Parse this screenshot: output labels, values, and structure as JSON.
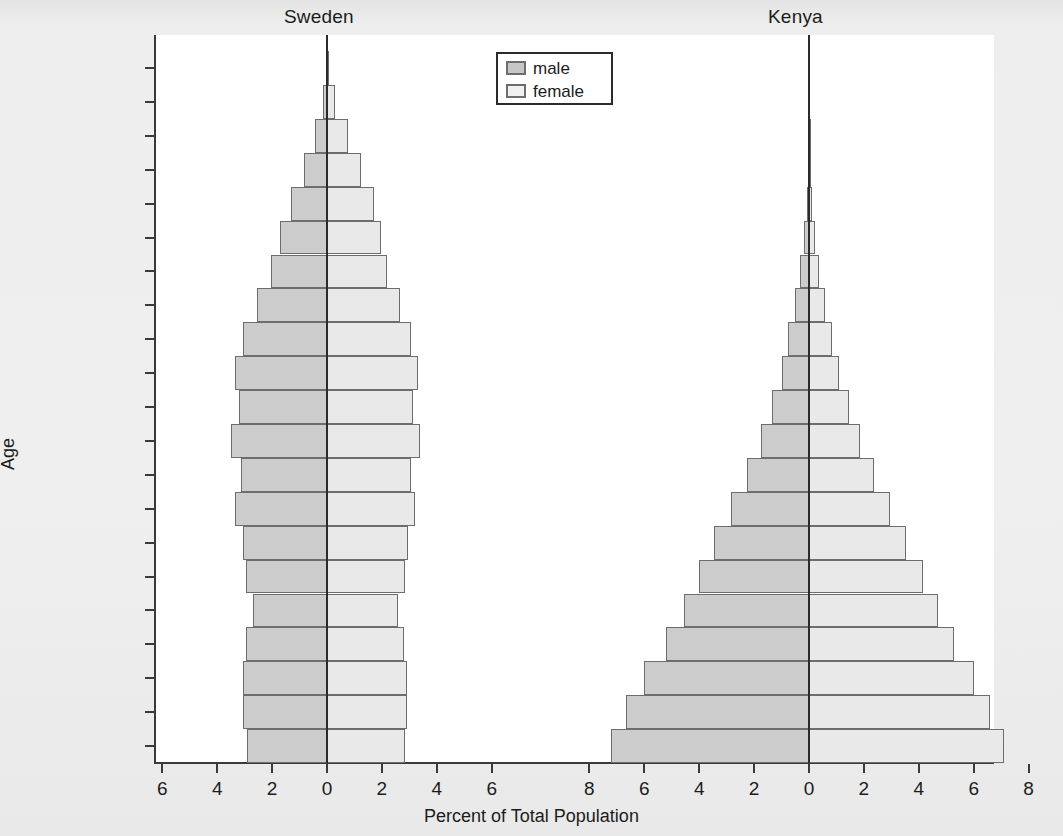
{
  "figure": {
    "x_axis_title": "Percent of Total Population",
    "y_axis_title": "Age",
    "panels": [
      {
        "id": "sweden",
        "title": "Sweden"
      },
      {
        "id": "kenya",
        "title": "Kenya"
      }
    ]
  },
  "legend": {
    "male_label": "male",
    "female_label": "female",
    "male_color": "#cccccc",
    "female_color": "#e9e9e9"
  },
  "chart_data": {
    "type": "bar",
    "subtype": "population-pyramid",
    "title": "",
    "xlabel": "Percent of Total Population",
    "ylabel": "Age",
    "grid": false,
    "legend_position": "top-center",
    "categories": [
      "0–4",
      "5–9",
      "10–14",
      "15–19",
      "20–24",
      "25–29",
      "30–34",
      "35–39",
      "40–44",
      "45–49",
      "50–54",
      "55–59",
      "60–64",
      "65–69",
      "70–74",
      "75–79",
      "80–84",
      "85–89",
      "90–94",
      "95–99",
      "100+"
    ],
    "y_tick_labels": [
      "100+",
      "95–99",
      "90–94",
      "85–89",
      "80–84",
      "75–79",
      "70–74",
      "65–69",
      "60–64",
      "55–59",
      "50–54",
      "45–49",
      "40–44",
      "35–39",
      "30–34",
      "25–29",
      "20–24",
      "15–19",
      "10–14",
      "5–9",
      "0–4"
    ],
    "x_tick_labels": [
      "6",
      "4",
      "2",
      "0",
      "2",
      "4",
      "6",
      "8",
      "6",
      "4",
      "2",
      "0",
      "2",
      "4",
      "6",
      "8"
    ],
    "panels": [
      {
        "name": "Sweden",
        "xlim": [
          -7.0,
          7.0
        ],
        "x_ticks": [
          6,
          4,
          2,
          0,
          2,
          4,
          6
        ],
        "series": [
          {
            "name": "male",
            "values": [
              2.9,
              3.05,
              3.05,
              2.95,
              2.7,
              2.95,
              3.05,
              3.35,
              3.15,
              3.5,
              3.2,
              3.35,
              3.05,
              2.55,
              2.05,
              1.7,
              1.3,
              0.85,
              0.45,
              0.15,
              0.03
            ]
          },
          {
            "name": "female",
            "values": [
              2.85,
              2.9,
              2.9,
              2.8,
              2.6,
              2.85,
              2.95,
              3.2,
              3.05,
              3.4,
              3.15,
              3.3,
              3.05,
              2.65,
              2.2,
              1.95,
              1.7,
              1.25,
              0.75,
              0.3,
              0.06
            ]
          }
        ]
      },
      {
        "name": "Kenya",
        "xlim": [
          -9.0,
          9.0
        ],
        "x_ticks": [
          8,
          6,
          4,
          2,
          0,
          2,
          4,
          6,
          8
        ],
        "series": [
          {
            "name": "male",
            "values": [
              7.2,
              6.65,
              6.0,
              5.2,
              4.55,
              4.0,
              3.45,
              2.85,
              2.25,
              1.75,
              1.35,
              1.0,
              0.75,
              0.52,
              0.33,
              0.18,
              0.09,
              0.04,
              0.01,
              0.0,
              0.0
            ]
          },
          {
            "name": "female",
            "values": [
              7.1,
              6.6,
              6.0,
              5.3,
              4.7,
              4.15,
              3.55,
              2.95,
              2.35,
              1.85,
              1.45,
              1.1,
              0.82,
              0.58,
              0.38,
              0.21,
              0.11,
              0.05,
              0.02,
              0.0,
              0.0
            ]
          }
        ]
      }
    ]
  }
}
